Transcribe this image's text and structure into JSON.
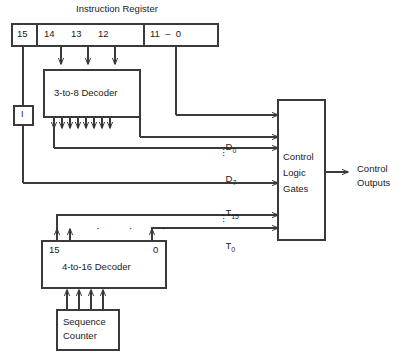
{
  "diagram": {
    "title": "Instruction Register",
    "instruction_register": {
      "name": "Instruction Register",
      "fields": [
        {
          "label": "15"
        },
        {
          "label": "14"
        },
        {
          "label": "13"
        },
        {
          "label": "12"
        },
        {
          "label": "11  –  0"
        }
      ]
    },
    "mode_box": {
      "label": "I"
    },
    "decoder_3to8": {
      "label": "3-to-8 Decoder"
    },
    "decoder_4to16": {
      "label": "4-to-16 Decoder",
      "left_index": "15",
      "right_index": "0",
      "dots": "·   ·   ·"
    },
    "sequence_counter": {
      "line1": "Sequence",
      "line2": "Counter"
    },
    "control_logic": {
      "line1": "Control",
      "line2": "Logic",
      "line3": "Gates"
    },
    "control_outputs": {
      "line1": "Control",
      "line2": "Outputs"
    },
    "signals": {
      "d_first": {
        "base": "D",
        "sub": "0"
      },
      "d_last": {
        "base": "D",
        "sub": "7"
      },
      "t_first": {
        "base": "T",
        "sub": "15"
      },
      "t_last": {
        "base": "T",
        "sub": "0"
      },
      "vertical_ellipsis": "·"
    },
    "colors": {
      "stroke": "#3a3a3a",
      "text": "#1a1a1a",
      "background": "#ffffff"
    }
  }
}
